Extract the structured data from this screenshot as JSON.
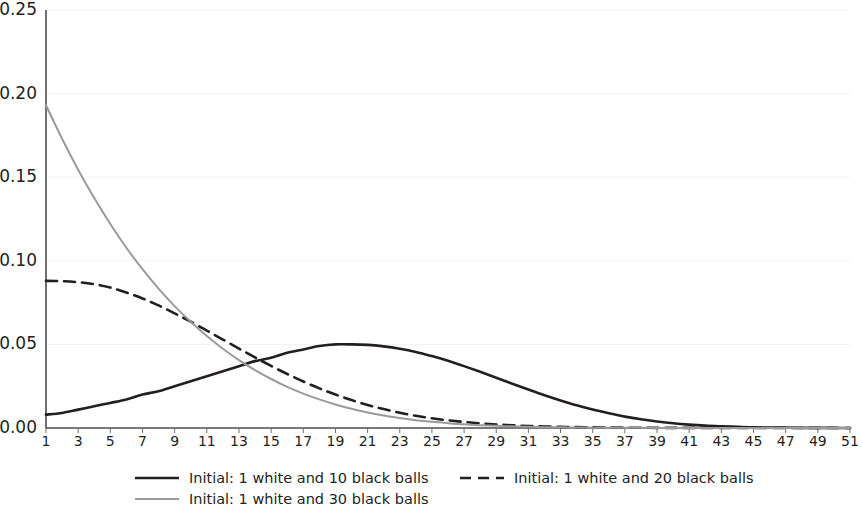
{
  "chart_data": {
    "type": "line",
    "title": "",
    "subtitle": "",
    "xlabel": "",
    "ylabel": "",
    "xlim": [
      1,
      51
    ],
    "ylim": [
      0.0,
      0.25
    ],
    "grid": true,
    "legend_position": "bottom",
    "y_ticks": [
      "0.00",
      "0.05",
      "0.10",
      "0.15",
      "0.20",
      "0.25"
    ],
    "y_tick_values": [
      0.0,
      0.05,
      0.1,
      0.15,
      0.2,
      0.25
    ],
    "x_ticks": [
      "1",
      "3",
      "5",
      "7",
      "9",
      "11",
      "13",
      "15",
      "17",
      "19",
      "21",
      "23",
      "25",
      "27",
      "29",
      "31",
      "33",
      "35",
      "37",
      "39",
      "41",
      "43",
      "45",
      "47",
      "49",
      "51"
    ],
    "x_tick_values": [
      1,
      3,
      5,
      7,
      9,
      11,
      13,
      15,
      17,
      19,
      21,
      23,
      25,
      27,
      29,
      31,
      33,
      35,
      37,
      39,
      41,
      43,
      45,
      47,
      49,
      51
    ],
    "x": [
      1,
      2,
      3,
      4,
      5,
      6,
      7,
      8,
      9,
      10,
      11,
      12,
      13,
      14,
      15,
      16,
      17,
      18,
      19,
      20,
      21,
      22,
      23,
      24,
      25,
      26,
      27,
      28,
      29,
      30,
      31,
      32,
      33,
      34,
      35,
      36,
      37,
      38,
      39,
      40,
      41,
      42,
      43,
      44,
      45,
      46,
      47,
      48,
      49,
      50,
      51
    ],
    "series": [
      {
        "name": "Initial: 1 white and 10 black balls",
        "style": "solid",
        "color": "#231f20",
        "width": 2.6,
        "values": [
          0.008,
          0.009,
          0.011,
          0.013,
          0.015,
          0.017,
          0.02,
          0.022,
          0.025,
          0.028,
          0.031,
          0.034,
          0.037,
          0.04,
          0.042,
          0.045,
          0.047,
          0.049,
          0.05,
          0.05,
          0.0497,
          0.0488,
          0.0474,
          0.0455,
          0.043,
          0.0402,
          0.037,
          0.0336,
          0.0301,
          0.0265,
          0.023,
          0.0196,
          0.0165,
          0.0136,
          0.011,
          0.0088,
          0.0068,
          0.0052,
          0.0039,
          0.0028,
          0.002,
          0.0014,
          0.001,
          0.0007,
          0.0004,
          0.0003,
          0.0002,
          0.0001,
          0.0001,
          5e-05,
          2e-05
        ]
      },
      {
        "name": "Initial: 1 white and 20 black balls",
        "style": "dashed",
        "color": "#231f20",
        "width": 2.6,
        "values": [
          0.088,
          0.0878,
          0.0872,
          0.086,
          0.084,
          0.081,
          0.0775,
          0.0733,
          0.0686,
          0.0636,
          0.0583,
          0.0529,
          0.0475,
          0.0422,
          0.0371,
          0.0323,
          0.0278,
          0.0237,
          0.02,
          0.0167,
          0.0138,
          0.0113,
          0.0091,
          0.0073,
          0.0058,
          0.0046,
          0.0036,
          0.0028,
          0.0021,
          0.0016,
          0.0012,
          0.0009,
          0.0007,
          0.0005,
          0.0004,
          0.0003,
          0.0002,
          0.00015,
          0.0001,
          8e-05,
          6e-05,
          4e-05,
          3e-05,
          2e-05,
          1e-05,
          1e-05,
          1e-05,
          5e-06,
          3e-06,
          2e-06,
          1e-06
        ]
      },
      {
        "name": "Initial: 1 white and 30 black balls",
        "style": "solid",
        "color": "#9a9a9a",
        "width": 2.0,
        "values": [
          0.193,
          0.173,
          0.1545,
          0.1375,
          0.122,
          0.1078,
          0.095,
          0.0834,
          0.0729,
          0.0635,
          0.055,
          0.0474,
          0.0406,
          0.0346,
          0.0293,
          0.0246,
          0.0206,
          0.0171,
          0.0141,
          0.0115,
          0.0093,
          0.0075,
          0.006,
          0.0047,
          0.0037,
          0.0029,
          0.0022,
          0.0017,
          0.0013,
          0.001,
          0.0007,
          0.0005,
          0.0004,
          0.0003,
          0.0002,
          0.00015,
          0.0001,
          8e-05,
          6e-05,
          4e-05,
          3e-05,
          2e-05,
          1e-05,
          1e-05,
          5e-06,
          4e-06,
          3e-06,
          2e-06,
          1e-06,
          1e-06,
          5e-07
        ]
      }
    ]
  },
  "legend": {
    "items": [
      {
        "label": "Initial: 1 white and 10 black balls"
      },
      {
        "label": "Initial: 1 white and 20 black balls"
      },
      {
        "label": "Initial: 1 white and 30 black balls"
      }
    ]
  },
  "colors": {
    "series_1": "#231f20",
    "series_2": "#231f20",
    "series_3": "#9a9a9a",
    "axis": "#4d4d4d",
    "grid": "#f2f2f2",
    "text": "#231f20",
    "background": "#ffffff"
  }
}
